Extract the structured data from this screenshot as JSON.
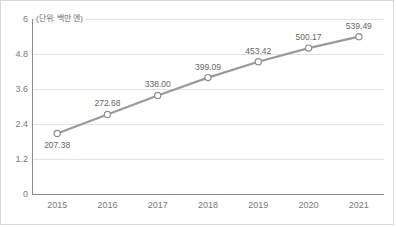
{
  "chart_data": {
    "type": "line",
    "title": "",
    "subtitle": "",
    "unit_label": "(단위: 백만 엔)",
    "xlabel": "",
    "ylabel": "",
    "categories": [
      "2015",
      "2016",
      "2017",
      "2018",
      "2019",
      "2020",
      "2021"
    ],
    "values": [
      207.38,
      272.68,
      338.0,
      399.09,
      453.42,
      500.17,
      539.49
    ],
    "point_labels": [
      "207.38",
      "272.68",
      "338.00",
      "399.09",
      "453.42",
      "500.17",
      "539.49"
    ],
    "series": [
      {
        "name": "",
        "values": [
          207.38,
          272.68,
          338.0,
          399.09,
          453.42,
          500.17,
          539.49
        ]
      }
    ],
    "y_ticks": [
      "0",
      "1.2",
      "2.4",
      "3.6",
      "4.8",
      "6"
    ],
    "y_tick_values": [
      0,
      1.2,
      2.4,
      3.6,
      4.8,
      6
    ],
    "ylim": [
      0,
      6
    ],
    "y_axis_scale_note": "axis ticks are in hundreds of the plotted values",
    "grid": true,
    "grid_axis": "y",
    "legend": false,
    "legend_position": "none",
    "colors": {
      "line": "#9a9a9a",
      "marker_fill": "#ffffff",
      "marker_stroke": "#8e8e8e",
      "grid": "#e2e2e2",
      "axis": "#8c8c8c",
      "text": "#7a7a7a",
      "label_text": "#666666",
      "border": "#d9d9d9",
      "background": "#ffffff"
    }
  }
}
